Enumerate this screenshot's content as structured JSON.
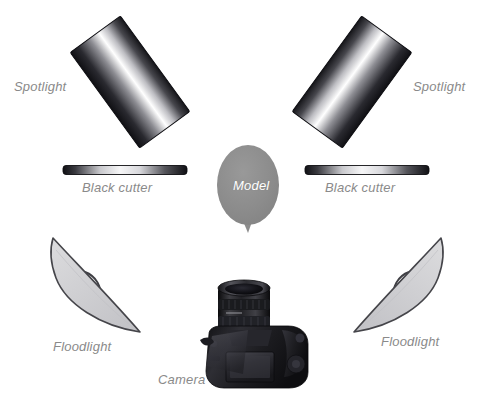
{
  "diagram": {
    "background_color": "#ffffff",
    "label_color": "#8a8a8a",
    "model_fill": "#8c8c8c",
    "floodlight_fill": "#d2d2d4",
    "floodlight_stroke": "#4a4a4a",
    "camera_body_color": "#1b1b1d"
  },
  "labels": {
    "spotlight_left": "Spotlight",
    "spotlight_right": "Spotlight",
    "black_cutter_left": "Black cutter",
    "black_cutter_right": "Black cutter",
    "model": "Model",
    "floodlight_left": "Floodlight",
    "floodlight_right": "Floodlight",
    "camera": "Camera"
  },
  "elements": [
    {
      "name": "spotlight-left",
      "kind": "spotlight",
      "label": "Spotlight",
      "shape": "rotated-rectangle",
      "rotation_deg": -36,
      "center": {
        "x": 130,
        "y": 82
      },
      "size": {
        "width": 62,
        "height": 118
      },
      "gradient": [
        "#15151a",
        "#ffffff",
        "#1a1a1f"
      ]
    },
    {
      "name": "spotlight-right",
      "kind": "spotlight",
      "label": "Spotlight",
      "shape": "rotated-rectangle",
      "rotation_deg": 36,
      "center": {
        "x": 352,
        "y": 82
      },
      "size": {
        "width": 62,
        "height": 118
      },
      "gradient": [
        "#15151a",
        "#ffffff",
        "#1a1a1f"
      ]
    },
    {
      "name": "black-cutter-left",
      "kind": "black-cutter",
      "label": "Black cutter",
      "shape": "bar",
      "center": {
        "x": 125,
        "y": 170
      },
      "size": {
        "width": 124,
        "height": 9
      },
      "gradient": [
        "#141418",
        "#f2f2f2",
        "#141418"
      ]
    },
    {
      "name": "black-cutter-right",
      "kind": "black-cutter",
      "label": "Black cutter",
      "shape": "bar",
      "center": {
        "x": 367,
        "y": 170
      },
      "size": {
        "width": 124,
        "height": 9
      },
      "gradient": [
        "#141418",
        "#f2f2f2",
        "#141418"
      ]
    },
    {
      "name": "model",
      "kind": "model",
      "label": "Model",
      "shape": "ellipse-with-chin",
      "center": {
        "x": 248,
        "y": 185
      },
      "size": {
        "width": 62,
        "height": 80
      },
      "fill": "#8c8c8c"
    },
    {
      "name": "floodlight-left",
      "kind": "floodlight",
      "label": "Floodlight",
      "shape": "crescent-reflector",
      "center": {
        "x": 96,
        "y": 288
      },
      "fill": "#d2d2d4"
    },
    {
      "name": "floodlight-right",
      "kind": "floodlight",
      "label": "Floodlight",
      "shape": "crescent-reflector",
      "center": {
        "x": 398,
        "y": 288
      },
      "fill": "#d2d2d4"
    },
    {
      "name": "camera",
      "kind": "camera",
      "label": "Camera",
      "shape": "dslr-top-view",
      "center": {
        "x": 252,
        "y": 340
      }
    }
  ]
}
